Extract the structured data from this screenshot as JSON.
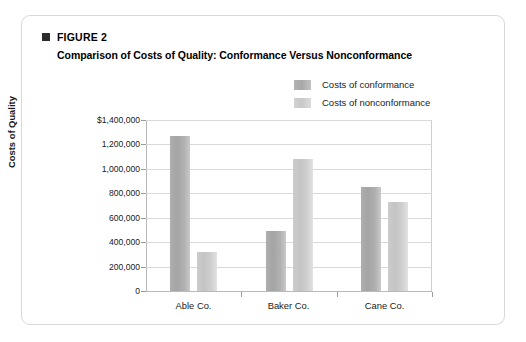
{
  "figure": {
    "marker_icon": "black-square-icon",
    "label": "FIGURE 2",
    "title": "Comparison of Costs of Quality: Conformance Versus Nonconformance"
  },
  "legend": {
    "items": [
      {
        "label": "Costs of conformance",
        "color": "#aaaaaa"
      },
      {
        "label": "Costs of nonconformance",
        "color": "#cccccc"
      }
    ]
  },
  "chart_data": {
    "type": "bar",
    "title": "Comparison of Costs of Quality: Conformance Versus Nonconformance",
    "xlabel": "",
    "ylabel": "Costs of Quality",
    "categories": [
      "Able Co.",
      "Baker Co.",
      "Cane Co."
    ],
    "series": [
      {
        "name": "Costs of conformance",
        "color": "#aaaaaa",
        "values": [
          1270000,
          490000,
          850000
        ]
      },
      {
        "name": "Costs of nonconformance",
        "color": "#cccccc",
        "values": [
          320000,
          1080000,
          730000
        ]
      }
    ],
    "ylim": [
      0,
      1400000
    ],
    "ytick_values": [
      0,
      200000,
      400000,
      600000,
      800000,
      1000000,
      1200000,
      1400000
    ],
    "ytick_labels": [
      "0",
      "200,000",
      "400,000",
      "600,000",
      "800,000",
      "1,000,000",
      "1,200,000",
      "$1,400,000"
    ],
    "grid": true,
    "legend_position": "top-right"
  },
  "colors": {
    "card_border": "#d8d8d8",
    "gridline": "#d9d9d9",
    "axis": "#b9b9b9",
    "text": "#1a1a1a"
  }
}
